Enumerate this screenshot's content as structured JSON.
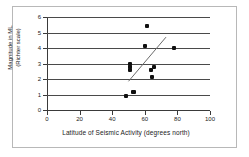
{
  "chart_data": {
    "type": "scatter",
    "title": "",
    "xlabel": "Latitude of Seismic Activity (degrees north)",
    "ylabel_line1": "Magnitude in ML",
    "ylabel_line2": "(Richter scale)",
    "xlim": [
      0,
      100
    ],
    "ylim": [
      0,
      6
    ],
    "xticks": [
      0,
      20,
      40,
      60,
      80,
      100
    ],
    "yticks": [
      0,
      1,
      2,
      3,
      4,
      5,
      6
    ],
    "grid": "horizontal",
    "legend": "none",
    "series": [
      {
        "name": "Seismic events",
        "marker": "filled-diamond",
        "color": "#101010",
        "points": [
          {
            "x": 48.5,
            "y": 0.9
          },
          {
            "x": 52.5,
            "y": 1.15
          },
          {
            "x": 53.5,
            "y": 1.15
          },
          {
            "x": 51.0,
            "y": 2.6
          },
          {
            "x": 51.0,
            "y": 2.75
          },
          {
            "x": 51.2,
            "y": 3.0
          },
          {
            "x": 60.0,
            "y": 4.1
          },
          {
            "x": 61.5,
            "y": 5.45
          },
          {
            "x": 64.0,
            "y": 2.6
          },
          {
            "x": 64.5,
            "y": 2.1
          },
          {
            "x": 65.5,
            "y": 2.75
          },
          {
            "x": 78.0,
            "y": 4.0
          }
        ]
      }
    ],
    "trendline": {
      "name": "Linear trend",
      "color": "#6b6b6b",
      "x0": 50.0,
      "y0": 1.85,
      "x1": 73.0,
      "y1": 4.7
    }
  }
}
